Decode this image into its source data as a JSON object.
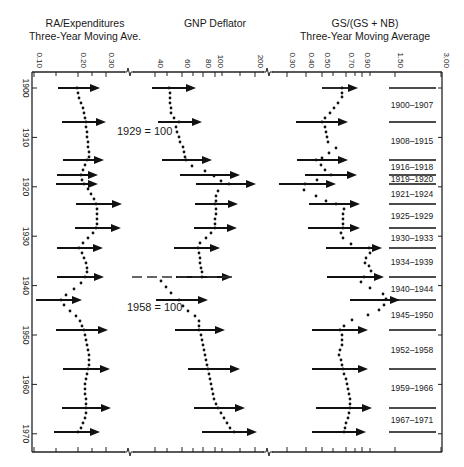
{
  "page_number": "300",
  "titles": {
    "left_line1": "RA/Expenditures",
    "left_line2": "Three-Year Moving Ave.",
    "middle": "GNP Deflator",
    "right_line1": "GS/(GS + NB)",
    "right_line2": "Three-Year Moving Average"
  },
  "annotations": {
    "base_1929": "1929 = 100",
    "base_1958": "1958 = 100"
  },
  "chart_data": {
    "type": "scatter",
    "title": "",
    "xlabel": "",
    "ylabel": "Year",
    "y_axis": {
      "ticks": [
        1900,
        1910,
        1920,
        1930,
        1940,
        1950,
        1960,
        1970
      ],
      "range": [
        1899,
        1972
      ]
    },
    "panels": [
      {
        "name": "RA/Expenditures Three-Year Moving Ave.",
        "scale": "log",
        "tick_labels": [
          "0.10",
          "0.20",
          "0.30"
        ],
        "xlim": [
          0.1,
          0.3
        ]
      },
      {
        "name": "GNP Deflator",
        "scale": "log",
        "tick_labels": [
          "40",
          "60",
          "80",
          "100",
          "200"
        ],
        "xlim": [
          40,
          200
        ],
        "annotations": [
          "1929 = 100",
          "1958 = 100"
        ],
        "rebase_year": 1940
      },
      {
        "name": "GS/(GS + NB) Three-Year Moving Average",
        "scale": "log",
        "tick_labels": [
          "0.30",
          "0.40",
          "0.50",
          "0.70",
          "0.90",
          "1.50",
          "3.00"
        ],
        "xlim": [
          0.3,
          3.0
        ]
      }
    ],
    "periods": [
      "1900-1907",
      "1908-1915",
      "1916-1918",
      "1919-1920",
      "1921-1924",
      "1925-1929",
      "1930-1933",
      "1934-1939",
      "1940-1944",
      "1945-1950",
      "1952-1958",
      "1959-1966",
      "1967-1971"
    ],
    "period_boundaries": [
      1900,
      1908,
      1916,
      1919,
      1920,
      1924,
      1929,
      1933,
      1939,
      1944,
      1950,
      1958,
      1966,
      1971
    ],
    "legend": {
      "position": "right",
      "entries": [
        "1900-1907",
        "1908-1915",
        "1916-1918",
        "1919-1920",
        "1921-1924",
        "1925-1929",
        "1930-1933",
        "1934-1939",
        "1940-1944",
        "1945-1950",
        "1952-1958",
        "1959-1966",
        "1967-1971"
      ]
    },
    "grid": false
  }
}
